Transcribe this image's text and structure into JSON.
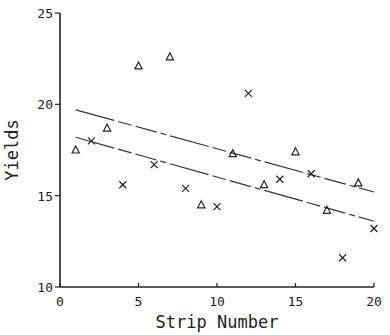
{
  "chart_data": {
    "type": "scatter",
    "title": "",
    "xlabel": "Strip Number",
    "ylabel": "Yields",
    "xlim": [
      0,
      20
    ],
    "ylim": [
      10,
      25
    ],
    "xticks": [
      0,
      5,
      10,
      15,
      20
    ],
    "xtick_labels": [
      "0",
      "5",
      "10",
      "15",
      "20"
    ],
    "yticks": [
      10,
      15,
      20,
      25
    ],
    "ytick_labels": [
      "10",
      "15",
      "20",
      "25"
    ],
    "grid": false,
    "legend": null,
    "series": [
      {
        "name": "triangle",
        "marker": "triangle",
        "points": [
          [
            1,
            17.5
          ],
          [
            3,
            18.7
          ],
          [
            5,
            22.1
          ],
          [
            7,
            22.6
          ],
          [
            9,
            14.5
          ],
          [
            11,
            17.3
          ],
          [
            13,
            15.6
          ],
          [
            15,
            17.4
          ],
          [
            17,
            14.2
          ],
          [
            19,
            15.7
          ]
        ]
      },
      {
        "name": "cross",
        "marker": "x",
        "points": [
          [
            2,
            18.0
          ],
          [
            4,
            15.6
          ],
          [
            6,
            16.7
          ],
          [
            8,
            15.4
          ],
          [
            10,
            14.4
          ],
          [
            12,
            20.6
          ],
          [
            14,
            15.9
          ],
          [
            16,
            16.2
          ],
          [
            18,
            11.6
          ],
          [
            20,
            13.2
          ]
        ]
      }
    ],
    "lines": [
      {
        "name": "upper-fit",
        "x": [
          1,
          20
        ],
        "y": [
          19.7,
          15.2
        ],
        "style": "solid-dashdot"
      },
      {
        "name": "lower-fit",
        "x": [
          1,
          20
        ],
        "y": [
          18.2,
          13.6
        ],
        "style": "solid-dashdot"
      }
    ]
  }
}
